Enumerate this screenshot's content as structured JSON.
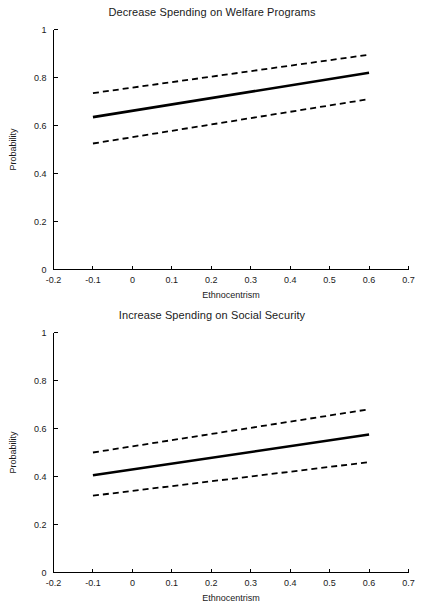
{
  "figure": {
    "background": "#ffffff",
    "ink_color": "#000000",
    "panel_count": 2
  },
  "chart_data": [
    {
      "type": "line",
      "title": "Decrease Spending on Welfare Programs",
      "xlabel": "Ethnocentrism",
      "ylabel": "Probability",
      "xlim": [
        -0.2,
        0.7
      ],
      "ylim": [
        0,
        1
      ],
      "xticks": [
        -0.2,
        -0.1,
        0,
        0.1,
        0.2,
        0.3,
        0.4,
        0.5,
        0.6,
        0.7
      ],
      "xticklabels": [
        "-0.2",
        "-0.1",
        "0",
        "0.1",
        "0.2",
        "0.3",
        "0.4",
        "0.5",
        "0.6",
        "0.7"
      ],
      "yticks": [
        0,
        0.2,
        0.4,
        0.6,
        0.8,
        1
      ],
      "yticklabels": [
        "0",
        "0.2",
        "0.4",
        "0.6",
        "0.8",
        "1"
      ],
      "grid": false,
      "legend": false,
      "x": [
        -0.1,
        0.6
      ],
      "series": [
        {
          "name": "Predicted probability",
          "style": "solid",
          "values": [
            0.635,
            0.82
          ]
        },
        {
          "name": "Upper 95% confidence bound",
          "style": "dashed",
          "values": [
            0.735,
            0.895
          ]
        },
        {
          "name": "Lower 95% confidence bound",
          "style": "dashed",
          "values": [
            0.525,
            0.71
          ]
        }
      ]
    },
    {
      "type": "line",
      "title": "Increase Spending on Social Security",
      "xlabel": "Ethnocentrism",
      "ylabel": "Probability",
      "xlim": [
        -0.2,
        0.7
      ],
      "ylim": [
        0,
        1
      ],
      "xticks": [
        -0.2,
        -0.1,
        0,
        0.1,
        0.2,
        0.3,
        0.4,
        0.5,
        0.6,
        0.7
      ],
      "xticklabels": [
        "-0.2",
        "-0.1",
        "0",
        "0.1",
        "0.2",
        "0.3",
        "0.4",
        "0.5",
        "0.6",
        "0.7"
      ],
      "yticks": [
        0,
        0.2,
        0.4,
        0.6,
        0.8,
        1
      ],
      "yticklabels": [
        "0",
        "0.2",
        "0.4",
        "0.6",
        "0.8",
        "1"
      ],
      "grid": false,
      "legend": false,
      "x": [
        -0.1,
        0.6
      ],
      "series": [
        {
          "name": "Predicted probability",
          "style": "solid",
          "values": [
            0.405,
            0.575
          ]
        },
        {
          "name": "Upper 95% confidence bound",
          "style": "dashed",
          "values": [
            0.5,
            0.68
          ]
        },
        {
          "name": "Lower 95% confidence bound",
          "style": "dashed",
          "values": [
            0.32,
            0.46
          ]
        }
      ]
    }
  ]
}
